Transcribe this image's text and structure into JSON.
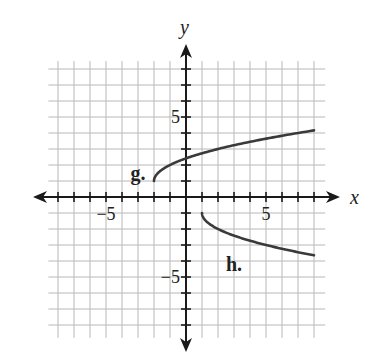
{
  "chart_data": {
    "type": "line",
    "title": "",
    "xlabel": "x",
    "ylabel": "y",
    "xlim": [
      -8.6,
      8.7
    ],
    "ylim": [
      -8.8,
      8.5
    ],
    "grid": true,
    "grid_step": 1,
    "x_tick_labels": [
      {
        "value": -5,
        "label": "−5"
      },
      {
        "value": 5,
        "label": "5"
      }
    ],
    "y_tick_labels": [
      {
        "value": 5,
        "label": "5"
      },
      {
        "value": -5,
        "label": "−5"
      }
    ],
    "series": [
      {
        "name": "g.",
        "label_position": [
          -3,
          1.5
        ],
        "points": [
          [
            -2,
            1
          ],
          [
            -1.75,
            1.5
          ],
          [
            -1,
            2
          ],
          [
            0,
            2.41
          ],
          [
            1,
            2.73
          ],
          [
            2,
            3
          ],
          [
            3,
            3.24
          ],
          [
            4,
            3.45
          ],
          [
            5,
            3.65
          ],
          [
            6,
            3.83
          ],
          [
            7,
            4
          ],
          [
            8,
            4.16
          ]
        ]
      },
      {
        "name": "h.",
        "label_position": [
          3,
          -4.2
        ],
        "points": [
          [
            1,
            -1
          ],
          [
            1.25,
            -1.5
          ],
          [
            2,
            -2
          ],
          [
            3,
            -2.41
          ],
          [
            4,
            -2.73
          ],
          [
            5,
            -3
          ],
          [
            6,
            -3.24
          ],
          [
            7,
            -3.45
          ],
          [
            8,
            -3.65
          ]
        ]
      }
    ]
  }
}
